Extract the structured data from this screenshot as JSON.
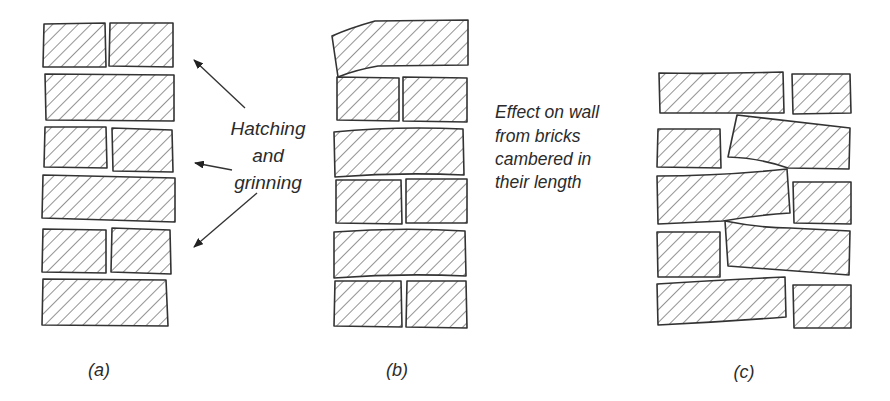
{
  "figure": {
    "colors": {
      "background": "#ffffff",
      "ink": "#333333",
      "hatch": "#3a3a3a"
    },
    "annotations": {
      "hatching": {
        "lines": [
          "Hatching",
          "and",
          "grinning"
        ]
      },
      "camber": {
        "lines": [
          "Effect on wall",
          "from bricks",
          "cambered in",
          "their length"
        ]
      }
    },
    "panels": [
      {
        "id": "a",
        "caption": "(a)",
        "description": "Wall with hatched bricks showing hatching and grinning"
      },
      {
        "id": "b",
        "caption": "(b)",
        "description": "Wall built from bricks cambered in their length"
      },
      {
        "id": "c",
        "caption": "(c)",
        "description": "Distorted wall with tilted bricks"
      }
    ],
    "arrows": [
      {
        "from": [
          245,
          108
        ],
        "to": [
          192,
          58
        ],
        "icon": "arrow-up-left"
      },
      {
        "from": [
          232,
          170
        ],
        "to": [
          193,
          163
        ],
        "icon": "arrow-left"
      },
      {
        "from": [
          257,
          193
        ],
        "to": [
          192,
          249
        ],
        "icon": "arrow-down-left"
      }
    ]
  }
}
